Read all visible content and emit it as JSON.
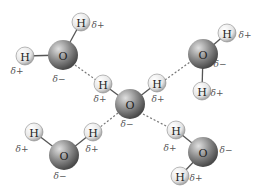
{
  "diagram": {
    "colors": {
      "oxygen_light": "#d0d0d0",
      "oxygen_dark": "#5a5a5a",
      "hydrogen_light": "#ffffff",
      "hydrogen_dark": "#b8b8b8",
      "bond": "#555555",
      "hbond": "#777777"
    },
    "labels": {
      "oxygen": "O",
      "hydrogen": "H",
      "partial_positive": "δ+",
      "partial_negative": "δ−"
    },
    "molecules": [
      {
        "name": "top-left",
        "O": [
          63,
          55
        ],
        "H": [
          [
            81,
            22
          ],
          [
            25,
            56
          ]
        ],
        "dplus": [
          [
            98,
            25
          ],
          [
            17,
            71
          ]
        ],
        "dminus": [
          59,
          79
        ]
      },
      {
        "name": "top-right",
        "O": [
          203,
          54
        ],
        "H": [
          [
            227,
            33
          ],
          [
            202,
            91
          ]
        ],
        "dplus": [
          [
            245,
            35
          ],
          [
            217,
            93
          ]
        ],
        "dminus": [
          220,
          64
        ]
      },
      {
        "name": "center",
        "O": [
          130,
          104
        ],
        "H": [
          [
            103,
            84
          ],
          [
            157,
            83
          ]
        ],
        "dplus": [
          [
            100,
            99
          ],
          [
            158,
            99
          ]
        ],
        "dminus": [
          127,
          124
        ]
      },
      {
        "name": "bottom-left",
        "O": [
          64,
          155
        ],
        "H": [
          [
            34,
            132
          ],
          [
            93,
            132
          ]
        ],
        "dplus": [
          [
            22,
            149
          ],
          [
            92,
            149
          ]
        ],
        "dminus": [
          60,
          176
        ]
      },
      {
        "name": "bottom-right",
        "O": [
          203,
          152
        ],
        "H": [
          [
            176,
            130
          ],
          [
            180,
            176
          ]
        ],
        "dplus": [
          [
            170,
            148
          ],
          [
            196,
            178
          ]
        ],
        "dminus": [
          226,
          150
        ]
      }
    ],
    "hydrogen_bonds": [
      {
        "from": [
          75,
          65
        ],
        "to": [
          96,
          80
        ]
      },
      {
        "from": [
          165,
          80
        ],
        "to": [
          190,
          62
        ]
      },
      {
        "from": [
          118,
          113
        ],
        "to": [
          99,
          128
        ]
      },
      {
        "from": [
          143,
          114
        ],
        "to": [
          168,
          127
        ]
      }
    ]
  }
}
